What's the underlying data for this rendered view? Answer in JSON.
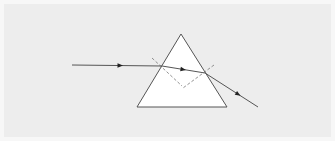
{
  "diagram": {
    "type": "optics",
    "colors": {
      "background": "#ededed",
      "outer_background": "#f7f7f7",
      "prism_fill": "#ffffff",
      "stroke": "#555555",
      "ray": "#555555",
      "normal": "#777777",
      "arrowhead": "#222222"
    },
    "prism": {
      "apex": [
        181,
        34
      ],
      "base_left": [
        137,
        107
      ],
      "base_right": [
        227,
        107
      ]
    },
    "rays": [
      {
        "name": "incident-ray",
        "from": [
          72,
          65
        ],
        "to": [
          162,
          66
        ],
        "arrow_at": [
          120,
          65.5
        ]
      },
      {
        "name": "refracted-ray",
        "from": [
          162,
          66
        ],
        "to": [
          205,
          73
        ],
        "arrow_at": [
          183,
          69.4
        ]
      },
      {
        "name": "emergent-ray",
        "from": [
          205,
          73
        ],
        "to": [
          258,
          107
        ],
        "arrow_at": [
          238,
          94.2
        ]
      }
    ],
    "normals": [
      {
        "name": "entry-normal",
        "from": [
          152,
          58
        ],
        "to": [
          182,
          86
        ]
      },
      {
        "name": "exit-normal",
        "from": [
          214,
          65
        ],
        "to": [
          183,
          88
        ]
      }
    ]
  }
}
